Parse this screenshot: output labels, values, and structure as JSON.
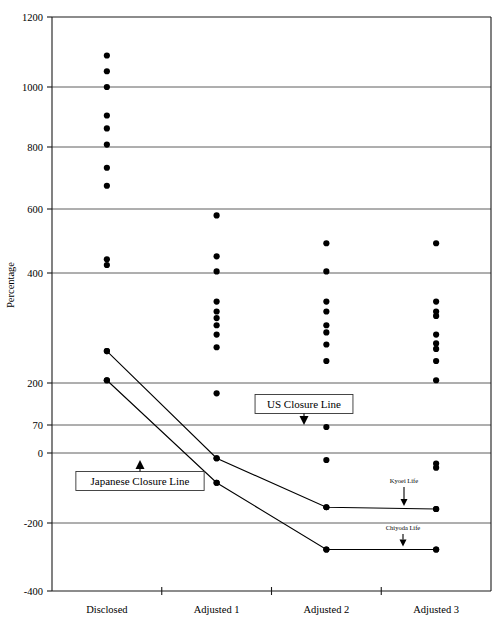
{
  "chart_data": {
    "type": "scatter",
    "title": "",
    "xlabel": "",
    "ylabel": "Percentage",
    "categories": [
      "Disclosed",
      "Adjusted 1",
      "Adjusted 2",
      "Adjusted 3"
    ],
    "ytick_labels": [
      "1200",
      "1000",
      "800",
      "600",
      "400",
      "200",
      "70",
      "0",
      "-200",
      "-400"
    ],
    "ytick_values": [
      1200,
      1000,
      800,
      600,
      400,
      200,
      70,
      0,
      -200,
      -400
    ],
    "ylim": [
      -400,
      1200
    ],
    "grid": true,
    "legend": "none",
    "scatter_points": {
      "Disclosed": [
        1090,
        1045,
        1000,
        905,
        862,
        808,
        733,
        675,
        443,
        425,
        258,
        205
      ],
      "Adjusted 1": [
        580,
        452,
        405,
        348,
        330,
        318,
        305,
        288,
        265,
        168,
        -15,
        -85
      ],
      "Adjusted 2": [
        493,
        405,
        348,
        330,
        305,
        292,
        270,
        240,
        65,
        -20,
        -155,
        -278
      ],
      "Adjusted 3": [
        493,
        348,
        330,
        322,
        288,
        272,
        262,
        240,
        205,
        -30,
        -42,
        -160,
        -278
      ]
    },
    "series": [
      {
        "name": "Kyoei Life",
        "x": [
          "Disclosed",
          "Adjusted 1",
          "Adjusted 2",
          "Adjusted 3"
        ],
        "values": [
          258,
          -15,
          -155,
          -160
        ]
      },
      {
        "name": "Chiyoda Life",
        "x": [
          "Disclosed",
          "Adjusted 1",
          "Adjusted 2",
          "Adjusted 3"
        ],
        "values": [
          205,
          -85,
          -278,
          -278
        ]
      }
    ],
    "annotations": [
      {
        "label": "US Closure Line",
        "points_to_value": 70,
        "boxed": true
      },
      {
        "label": "Japanese Closure Line",
        "points_to_value": 0,
        "boxed": true
      },
      {
        "label": "Kyoei Life",
        "points_to_value": -160,
        "boxed": false
      },
      {
        "label": "Chiyoda Life",
        "points_to_value": -278,
        "boxed": false
      }
    ]
  },
  "colors": {
    "dot": "#000000",
    "gridline": "#4c4c4c",
    "frame": "#1a1a1a",
    "background": "#ffffff"
  }
}
